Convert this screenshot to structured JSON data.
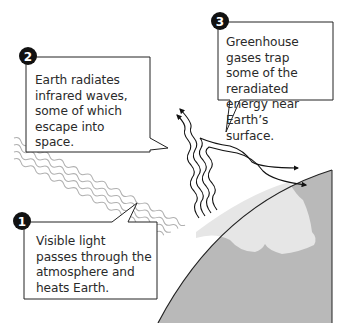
{
  "diagram": {
    "colors": {
      "earth": "#b9b9b9",
      "land": "#e6e6e6",
      "outline": "#222222",
      "sunlight": "#b0b0b0",
      "infrared": "#111111",
      "badge": "#111111"
    },
    "callouts": [
      {
        "number": "1",
        "text": "Visible light\npasses through the\natmosphere and\nheats Earth."
      },
      {
        "number": "2",
        "text": "Earth radiates\ninfrared waves,\nsome of which\nescape into space."
      },
      {
        "number": "3",
        "text": "Greenhouse gases trap\nsome of the reradiated\nenergy near Earth’s\nsurface."
      }
    ],
    "elements": [
      {
        "name": "sunlight-waves",
        "description": "Visible light (grey wavy lines) from upper left toward Earth"
      },
      {
        "name": "infrared-waves-escaping",
        "description": "Infrared waves rising and escaping into space"
      },
      {
        "name": "infrared-waves-trapped",
        "description": "Infrared waves bending back toward Earth"
      },
      {
        "name": "earth-surface",
        "description": "Curved section of Earth with land mass"
      }
    ]
  }
}
